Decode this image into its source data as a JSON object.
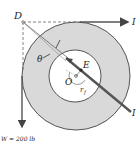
{
  "diagram": {
    "labels": {
      "point_d": "D",
      "point_e": "E",
      "point_o": "O",
      "angle": "θ",
      "radius": "r",
      "radius_sub": "f",
      "right_top_label": "I",
      "right_bottom_label": "I",
      "weight": "W = 200 lb"
    },
    "colors": {
      "ring_fill": "#d9d9d9",
      "line": "#444444",
      "thick_line": "#555555",
      "background": "#ffffff"
    }
  }
}
